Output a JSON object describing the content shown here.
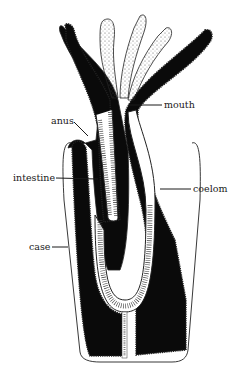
{
  "diagram": {
    "colors": {
      "background": "#ffffff",
      "tissue": "#0a0a0a",
      "epithelium": "#ffffff",
      "outline": "#222222",
      "label": "#1a1a1a"
    },
    "labels": [
      {
        "id": "mouth",
        "text": "mouth",
        "x": 164,
        "y": 110
      },
      {
        "id": "anus",
        "text": "anus",
        "x": 51,
        "y": 121
      },
      {
        "id": "intestine",
        "text": "intestine",
        "x": 13,
        "y": 180
      },
      {
        "id": "coelom",
        "text": "coelom",
        "x": 193,
        "y": 192
      },
      {
        "id": "case",
        "text": "case",
        "x": 29,
        "y": 250
      }
    ]
  }
}
